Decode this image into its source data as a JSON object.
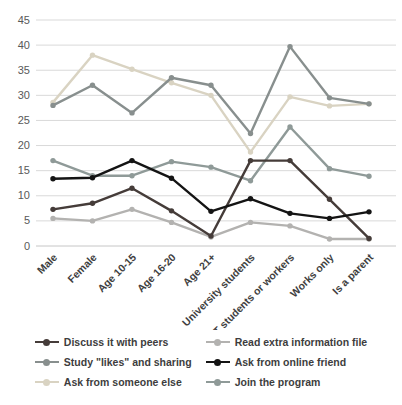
{
  "chart_data": {
    "type": "line",
    "title": "",
    "xlabel": "",
    "ylabel": "",
    "ylim": [
      0,
      45
    ],
    "ytick_step": 5,
    "grid": "horizontal",
    "legend_position": "bottom-two-columns",
    "categories": [
      "Male",
      "Female",
      "Age 10-15",
      "Age 16-20",
      "Age 21+",
      "University students",
      "IT students or workers",
      "Works only",
      "Is a parent"
    ],
    "series": [
      {
        "name": "Discuss it with peers",
        "color": "#453c39",
        "values": [
          7.3,
          8.5,
          11.5,
          7,
          2,
          17,
          17,
          9.3,
          1.5
        ]
      },
      {
        "name": "Read extra information file",
        "color": "#b3b2b0",
        "values": [
          5.5,
          5,
          7.3,
          4.7,
          1.8,
          4.7,
          4,
          1.4,
          1.4
        ]
      },
      {
        "name": "Study \"likes\" and sharing",
        "color": "#888f8e",
        "values": [
          28,
          32,
          26.5,
          33.5,
          32,
          22.4,
          39.7,
          29.5,
          28.3
        ]
      },
      {
        "name": "Ask from online friend",
        "color": "#141414",
        "values": [
          13.4,
          13.6,
          17,
          13.5,
          6.9,
          9.4,
          6.5,
          5.5,
          6.8
        ]
      },
      {
        "name": "Ask from someone else",
        "color": "#d9d3c2",
        "values": [
          28.6,
          38,
          35.2,
          32.5,
          30,
          18.7,
          29.7,
          27.9,
          28.3
        ]
      },
      {
        "name": "Join the program",
        "color": "#8f9a98",
        "values": [
          17,
          14,
          14,
          16.8,
          15.7,
          13,
          23.7,
          15.4,
          13.9
        ]
      }
    ],
    "colors": {
      "gridline": "#d9d9d9",
      "axis_line": "#c6c6c6",
      "tick_label": "#595959",
      "category_label": "#3f3f3f",
      "legend_text": "#3d3d3d",
      "background": "#ffffff"
    }
  }
}
